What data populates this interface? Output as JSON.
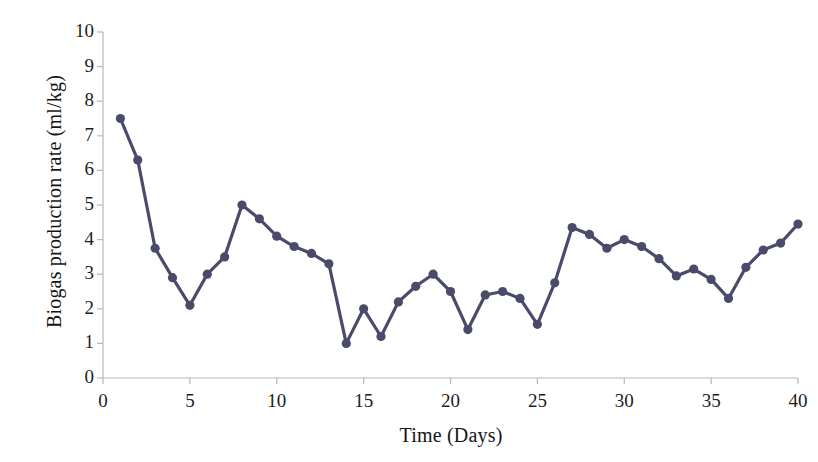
{
  "chart_data": {
    "type": "line",
    "title": "",
    "xlabel": "Time (Days)",
    "ylabel": "Biogas production rate (ml/kg)",
    "xlim": [
      0,
      40
    ],
    "ylim": [
      0,
      10
    ],
    "xticks": [
      0,
      5,
      10,
      15,
      20,
      25,
      30,
      35,
      40
    ],
    "yticks": [
      0,
      1,
      2,
      3,
      4,
      5,
      6,
      7,
      8,
      9,
      10
    ],
    "grid": false,
    "legend": null,
    "marker": "circle",
    "series_color": "#4a4a6a",
    "x": [
      1,
      2,
      3,
      4,
      5,
      6,
      7,
      8,
      9,
      10,
      11,
      12,
      13,
      14,
      15,
      16,
      17,
      18,
      19,
      20,
      21,
      22,
      23,
      24,
      25,
      26,
      27,
      28,
      29,
      30,
      31,
      32,
      33,
      34,
      35,
      36,
      37,
      38,
      39,
      40
    ],
    "values": [
      7.5,
      6.3,
      3.75,
      2.9,
      2.1,
      3.0,
      3.5,
      5.0,
      4.6,
      4.1,
      3.8,
      3.6,
      3.3,
      1.0,
      2.0,
      1.2,
      2.2,
      2.65,
      3.0,
      2.5,
      1.4,
      2.4,
      2.5,
      2.3,
      1.55,
      2.75,
      4.35,
      4.15,
      3.75,
      4.0,
      3.8,
      3.45,
      2.95,
      3.15,
      2.85,
      2.3,
      3.2,
      3.7,
      3.9,
      4.45
    ]
  },
  "axes": {
    "y_title": "Biogas production rate (ml/kg)",
    "x_title": "Time (Days)",
    "y_tick_labels": [
      "10",
      "9",
      "8",
      "7",
      "6",
      "5",
      "4",
      "3",
      "2",
      "1",
      "0"
    ],
    "x_tick_labels": [
      "0",
      "5",
      "10",
      "15",
      "20",
      "25",
      "30",
      "35",
      "40"
    ]
  },
  "colors": {
    "series": "#4a4a6a",
    "axis": "#b8b8b8",
    "text": "#1a1a1a",
    "background": "#ffffff"
  }
}
